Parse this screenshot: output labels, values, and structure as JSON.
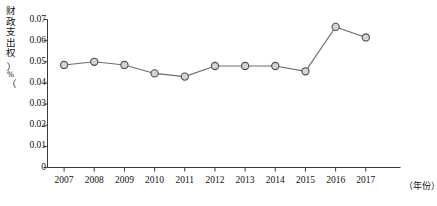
{
  "chart_data": {
    "type": "line",
    "title": "",
    "xlabel": "（年份）",
    "ylabel": "财政支出权（%）",
    "ylabel_chars": "财\n政\n支\n出\n权",
    "yunit": "%",
    "categories": [
      "2007",
      "2008",
      "2009",
      "2010",
      "2011",
      "2012",
      "2013",
      "2014",
      "2015",
      "2016",
      "2017"
    ],
    "values": [
      0.0485,
      0.05,
      0.0485,
      0.0445,
      0.043,
      0.048,
      0.048,
      0.048,
      0.0455,
      0.0665,
      0.0615
    ],
    "ytick_labels": [
      "0.07",
      "0.06",
      "0.05",
      "0.04",
      "0.03",
      "0.02",
      "0.01",
      "0"
    ],
    "ytick_values": [
      0.07,
      0.06,
      0.05,
      0.04,
      0.03,
      0.02,
      0.01,
      0
    ],
    "ylim": [
      0,
      0.07
    ],
    "xlim": [
      "2007",
      "2017"
    ],
    "grid": false,
    "legend": "none",
    "series": [
      {
        "name": "财政支出权",
        "values": [
          0.0485,
          0.05,
          0.0485,
          0.0445,
          0.043,
          0.048,
          0.048,
          0.048,
          0.0455,
          0.0665,
          0.0615
        ]
      }
    ],
    "colors": {
      "line": "#6b6b6b",
      "marker_fill": "#d4d4d4",
      "marker_stroke": "#4d4d4d",
      "axis": "#3a3a3a",
      "text": "#111111"
    }
  }
}
